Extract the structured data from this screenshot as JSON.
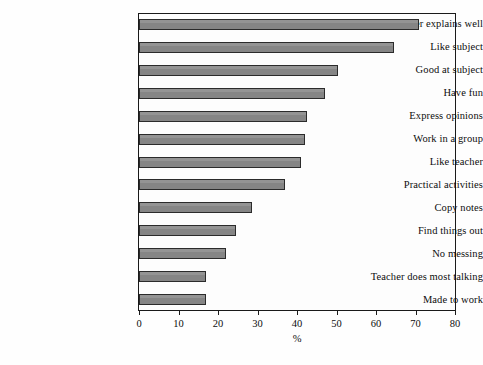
{
  "chart_data": {
    "type": "bar",
    "orientation": "horizontal",
    "title": "",
    "xlabel": "%",
    "ylabel": "",
    "xlim": [
      0,
      80
    ],
    "xticks": [
      0,
      10,
      20,
      30,
      40,
      50,
      60,
      70,
      80
    ],
    "grid": false,
    "legend": null,
    "bar_color": "#858585",
    "bar_edge_color": "#2b2b2b",
    "categories": [
      "Teacher explains well",
      "Like subject",
      "Good at subject",
      "Have fun",
      "Express opinions",
      "Work in a group",
      "Like teacher",
      "Practical activities",
      "Copy notes",
      "Find things out",
      "No messing",
      "Teacher does most talking",
      "Made to work"
    ],
    "values": [
      71,
      64.5,
      50.5,
      47,
      42.5,
      42,
      41,
      37,
      28.5,
      24.5,
      22,
      17,
      17
    ]
  }
}
